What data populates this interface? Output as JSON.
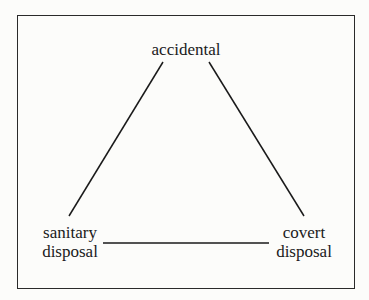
{
  "diagram": {
    "type": "triangle",
    "nodes": {
      "top": {
        "line1": "accidental"
      },
      "bottom_left": {
        "line1": "sanitary",
        "line2": "disposal"
      },
      "bottom_right": {
        "line1": "covert",
        "line2": "disposal"
      }
    },
    "edges": [
      {
        "from": "accidental",
        "to": "sanitary disposal"
      },
      {
        "from": "accidental",
        "to": "covert disposal"
      },
      {
        "from": "sanitary disposal",
        "to": "covert disposal"
      }
    ]
  }
}
